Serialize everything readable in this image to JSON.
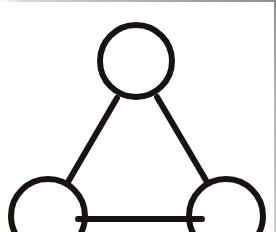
{
  "canvas": {
    "width": 276,
    "height": 232,
    "background_color": "#ffffff",
    "title": "Triangle node diagram"
  },
  "style": {
    "stroke_color": "#1a1210",
    "stroke_width": 6,
    "fill_color": "none",
    "frame_color": "#9a9a9a"
  },
  "nodes": [
    {
      "id": "node-top",
      "label": "top node",
      "shape": "circle",
      "cx": 136,
      "cy": 61,
      "r": 36
    },
    {
      "id": "node-bottom-left",
      "label": "bottom left node",
      "shape": "circle",
      "cx": 48,
      "cy": 216,
      "r": 37
    },
    {
      "id": "node-bottom-right",
      "label": "bottom right node",
      "shape": "circle",
      "cx": 226,
      "cy": 216,
      "r": 37
    }
  ],
  "edges": [
    {
      "id": "edge-left",
      "label": "top to bottom left",
      "x1": 117,
      "y1": 98,
      "x2": 68,
      "y2": 182
    },
    {
      "id": "edge-right",
      "label": "top to bottom right",
      "x1": 157,
      "y1": 97,
      "x2": 207,
      "y2": 182
    },
    {
      "id": "edge-bottom",
      "label": "bottom left to bottom right",
      "x1": 78,
      "y1": 219,
      "x2": 202,
      "y2": 219
    }
  ]
}
